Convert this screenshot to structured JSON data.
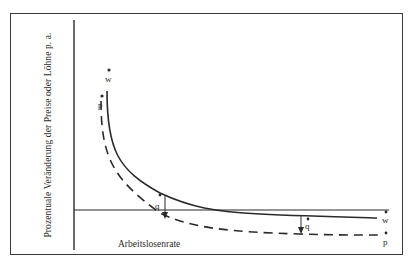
{
  "figure": {
    "y_axis_label": "Prozentuale Veränderung der Preise oder Löhne p. a.",
    "x_axis_label": "Arbeitslosenrate",
    "curves": [
      {
        "id": "w",
        "label": "w",
        "style": "solid",
        "description": "Lohnänderungsrate"
      },
      {
        "id": "p",
        "label": "p",
        "style": "dashed",
        "description": "Preisänderungsrate"
      }
    ],
    "gap_labels": [
      "q",
      "q"
    ],
    "colors": {
      "line": "#2a2a2a",
      "frame": "#3a3a3a",
      "background": "#ffffff"
    }
  },
  "labels": {
    "w_top": "w",
    "p_top": "p",
    "q_left": "q",
    "q_right": "q",
    "w_right": "w",
    "p_right": "p"
  }
}
